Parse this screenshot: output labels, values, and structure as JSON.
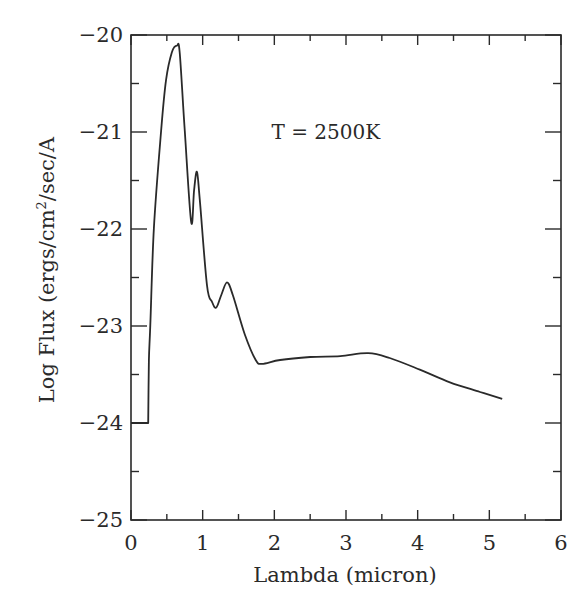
{
  "chart_data": {
    "type": "line",
    "title": "",
    "xlabel": "Lambda (micron)",
    "ylabel": "Log Flux (ergs/cm²/sec/A",
    "xlim": [
      0,
      6
    ],
    "ylim": [
      -25,
      -20
    ],
    "xticks": [
      0,
      1,
      2,
      3,
      4,
      5,
      6
    ],
    "xtick_labels": [
      "0",
      "1",
      "2",
      "3",
      "4",
      "5",
      "6"
    ],
    "xminor": [
      0.5,
      1.5,
      2.5,
      3.5,
      4.5,
      5.5
    ],
    "yticks": [
      -25,
      -24,
      -23,
      -22,
      -21,
      -20
    ],
    "ytick_labels": [
      "−25",
      "−24",
      "−23",
      "−22",
      "−21",
      "−20"
    ],
    "yminor": [
      -24.5,
      -23.5,
      -22.5,
      -21.5,
      -20.5
    ],
    "grid": false,
    "legend": null,
    "annotations": [
      {
        "text": "T = 2500K",
        "x": 1.96,
        "y": -21.07
      }
    ],
    "series": [
      {
        "name": "T = 2500K spectrum",
        "color": "#2a2a2a",
        "x": [
          0,
          0.24,
          0.25,
          0.27,
          0.32,
          0.42,
          0.49,
          0.57,
          0.64,
          0.68,
          0.75,
          0.84,
          0.88,
          0.92,
          0.96,
          1.06,
          1.13,
          1.19,
          1.26,
          1.34,
          1.42,
          1.59,
          1.74,
          1.83,
          2.08,
          2.5,
          2.92,
          3.31,
          3.61,
          4.03,
          4.45,
          4.87,
          5.18
        ],
        "y": [
          -24,
          -24,
          -23.35,
          -22.99,
          -21.99,
          -20.99,
          -20.46,
          -20.18,
          -20.11,
          -20.18,
          -20.99,
          -21.93,
          -21.6,
          -21.41,
          -21.7,
          -22.58,
          -22.75,
          -22.81,
          -22.68,
          -22.55,
          -22.68,
          -23.09,
          -23.35,
          -23.39,
          -23.35,
          -23.32,
          -23.31,
          -23.28,
          -23.33,
          -23.45,
          -23.58,
          -23.68,
          -23.75
        ]
      }
    ]
  }
}
